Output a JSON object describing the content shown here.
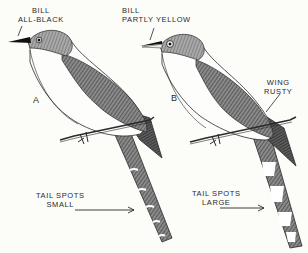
{
  "figure": {
    "birds": [
      {
        "letter": "A",
        "bill_label": [
          "BILL",
          "ALL-BLACK"
        ],
        "tail_label": [
          "TAIL SPOTS",
          "SMALL"
        ]
      },
      {
        "letter": "B",
        "bill_label": [
          "BILL",
          "PARTLY YELLOW"
        ],
        "wing_label": [
          "WING",
          "RUSTY"
        ],
        "tail_label": [
          "TAIL SPOTS",
          "LARGE"
        ]
      }
    ],
    "colors": {
      "background": "#fcfcf9",
      "ink": "#2a2a2a",
      "shade": "#6e6e6e"
    }
  }
}
